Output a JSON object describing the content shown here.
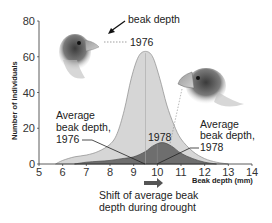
{
  "chart_data": {
    "type": "area",
    "title": "",
    "xlabel": "Beak depth (mm)",
    "ylabel": "Number of individuals",
    "xlim": [
      5,
      14
    ],
    "ylim": [
      0,
      80
    ],
    "x_ticks": [
      "5",
      "6",
      "7",
      "8",
      "9",
      "10",
      "11",
      "12",
      "13",
      "14"
    ],
    "y_ticks": [
      "0",
      "20",
      "40",
      "60",
      "80"
    ],
    "grid": false,
    "series": [
      {
        "name": "1976",
        "color": "#d6d6d6",
        "x": [
          5.7,
          6.0,
          6.5,
          7.0,
          7.5,
          8.0,
          8.3,
          8.6,
          8.9,
          9.2,
          9.5,
          9.8,
          10.1,
          10.4,
          10.7,
          11.0,
          11.5,
          12.0,
          12.5,
          13.0
        ],
        "values": [
          0,
          2,
          4,
          5,
          7,
          11,
          17,
          30,
          48,
          60,
          63,
          60,
          48,
          33,
          22,
          14,
          7,
          3,
          1,
          0
        ]
      },
      {
        "name": "1978",
        "color": "#6e6e6e",
        "x": [
          6.5,
          7.0,
          7.5,
          8.0,
          8.5,
          9.0,
          9.5,
          9.8,
          10.2,
          10.6,
          11.0,
          11.5,
          12.0,
          12.5
        ],
        "values": [
          0,
          1,
          1.5,
          2,
          3,
          4,
          7,
          10,
          12,
          10,
          6,
          3,
          1,
          0
        ]
      }
    ],
    "annotations": [
      {
        "text": "beak depth",
        "type": "arrow-label"
      },
      {
        "text": "1976",
        "target": "1976 peak / finch head"
      },
      {
        "text": "1978",
        "target": "1978 curve"
      },
      {
        "text": "Average beak depth, 1976",
        "x": 9.5
      },
      {
        "text": "Average beak depth, 1978",
        "x": 10.0
      },
      {
        "text": "Shift of average beak depth during drought",
        "type": "arrow"
      }
    ],
    "means": {
      "1976": 9.5,
      "1978": 10.0
    },
    "legend": "none"
  },
  "labels": {
    "beak_depth_pointer": "beak depth",
    "year_1976": "1976",
    "year_1978": "1978",
    "avg_1976_line1": "Average",
    "avg_1976_line2": "beak depth,",
    "avg_1976_line3": "1976",
    "avg_1978_line1": "Average",
    "avg_1978_line2": "beak depth,",
    "avg_1978_line3": "1978",
    "shift_line1": "Shift of average beak",
    "shift_line2": "depth during drought",
    "xlabel": "Beak depth (mm)",
    "ylabel": "Number of individuals"
  }
}
